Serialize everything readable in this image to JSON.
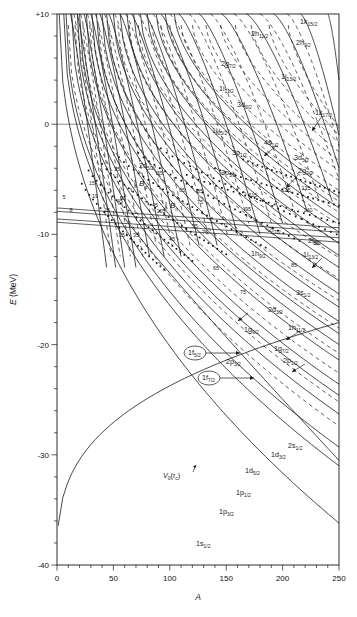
{
  "figure": {
    "domain": "chart",
    "background": "#ffffff",
    "line_color": "#1a1a1a"
  },
  "chart_data": {
    "type": "line",
    "title": "",
    "xlabel": "A",
    "ylabel": "E (MeV)",
    "xlim": [
      0,
      250
    ],
    "ylim": [
      -40,
      10
    ],
    "xticks": [
      0,
      50,
      100,
      150,
      200,
      250
    ],
    "xticklabels": [
      "0",
      "50",
      "100",
      "150",
      "200",
      "250"
    ],
    "yticks": [
      10,
      0,
      -10,
      -20,
      -30,
      -40
    ],
    "yticklabels": [
      "+10",
      "0",
      "-10",
      "-20",
      "-30",
      "-40"
    ],
    "minor_tick_step_y": 2,
    "minor_tick_step_x": 10,
    "grid": false,
    "legend": null,
    "orbital_labels": [
      {
        "label": "1k",
        "sub": "15/2",
        "x": 300,
        "y": 24
      },
      {
        "label": "2h",
        "sub": "11/2",
        "x": 251,
        "y": 36
      },
      {
        "label": "2h",
        "sub": "9/2",
        "x": 296,
        "y": 45
      },
      {
        "label": "2g",
        "sub": "7/2",
        "x": 221,
        "y": 66
      },
      {
        "label": "1j",
        "sub": "13/2",
        "x": 281,
        "y": 79
      },
      {
        "label": "1i",
        "sub": "11/2",
        "x": 219,
        "y": 91
      },
      {
        "label": "3d",
        "sub": "3/2",
        "x": 237,
        "y": 107
      },
      {
        "label": "1k",
        "sub": "17/2",
        "x": 315,
        "y": 115
      },
      {
        "label": "4s",
        "sub": "1/2",
        "x": 264,
        "y": 145
      },
      {
        "label": "1j",
        "sub": "15/2",
        "x": 212,
        "y": 133
      },
      {
        "label": "3p",
        "sub": "1/2",
        "x": 232,
        "y": 155
      },
      {
        "label": "3d",
        "sub": "5/2",
        "x": 294,
        "y": 160
      },
      {
        "label": "3p",
        "sub": "3/2",
        "x": 221,
        "y": 175
      },
      {
        "label": "2g",
        "sub": "9/2",
        "x": 298,
        "y": 173
      },
      {
        "label": "2d",
        "sub": "5/2",
        "x": 139,
        "y": 168
      },
      {
        "label": "2f",
        "sub": "7/2",
        "x": 268,
        "y": 232
      },
      {
        "label": "2f",
        "sub": "5/2",
        "x": 308,
        "y": 243
      },
      {
        "label": "1h",
        "sub": "9/2",
        "x": 251,
        "y": 256
      },
      {
        "label": "1i",
        "sub": "13/2",
        "x": 303,
        "y": 257
      },
      {
        "label": "3s",
        "sub": "1/2",
        "x": 296,
        "y": 295
      },
      {
        "label": "2d",
        "sub": "3/2",
        "x": 268,
        "y": 312
      },
      {
        "label": "1h",
        "sub": "11/2",
        "x": 288,
        "y": 330
      },
      {
        "label": "1g",
        "sub": "9/2",
        "x": 244,
        "y": 332
      },
      {
        "label": "1g",
        "sub": "7/2",
        "x": 274,
        "y": 351
      },
      {
        "label": "2p",
        "sub": "3/2",
        "x": 226,
        "y": 364
      },
      {
        "label": "2p",
        "sub": "1/2",
        "x": 283,
        "y": 363
      },
      {
        "label": "2s",
        "sub": "1/2",
        "x": 288,
        "y": 448
      },
      {
        "label": "1d",
        "sub": "3/2",
        "x": 271,
        "y": 457
      },
      {
        "label": "1d",
        "sub": "5/2",
        "x": 245,
        "y": 473
      },
      {
        "label": "1p",
        "sub": "1/2",
        "x": 236,
        "y": 495
      },
      {
        "label": "1p",
        "sub": "3/2",
        "x": 219,
        "y": 514
      },
      {
        "label": "1s",
        "sub": "1/2",
        "x": 196,
        "y": 546
      }
    ],
    "circled_labels": [
      {
        "label": "1f",
        "sub": "5/2",
        "x": 188,
        "y": 355
      },
      {
        "label": "1f",
        "sub": "7/2",
        "x": 202,
        "y": 380
      }
    ],
    "binding_labels": [
      {
        "label": "B",
        "sub": "p",
        "x": 139,
        "y": 186
      },
      {
        "label": "B",
        "sub": "n",
        "x": 170,
        "y": 208
      }
    ],
    "potential_label": {
      "label": "V",
      "sub": "0",
      "suffix": "(r",
      "suffix_sub": "c",
      "suffix_end": ")",
      "x": 163,
      "y": 478
    },
    "magic_numbers": [
      {
        "value": "5",
        "x": 64,
        "y": 199
      },
      {
        "value": "8",
        "x": 71,
        "y": 212
      },
      {
        "value": "15",
        "x": 92,
        "y": 185
      },
      {
        "value": "19",
        "x": 95,
        "y": 198
      },
      {
        "value": "25",
        "x": 107,
        "y": 212
      },
      {
        "value": "25",
        "x": 122,
        "y": 237
      },
      {
        "value": "35",
        "x": 117,
        "y": 171
      },
      {
        "value": "35",
        "x": 136,
        "y": 237
      },
      {
        "value": "45",
        "x": 120,
        "y": 203
      },
      {
        "value": "45",
        "x": 155,
        "y": 207
      },
      {
        "value": "45",
        "x": 172,
        "y": 241
      },
      {
        "value": "55",
        "x": 160,
        "y": 175
      },
      {
        "value": "55",
        "x": 195,
        "y": 228
      },
      {
        "value": "65",
        "x": 182,
        "y": 192
      },
      {
        "value": "65",
        "x": 216,
        "y": 270
      },
      {
        "value": "75",
        "x": 200,
        "y": 204
      },
      {
        "value": "75",
        "x": 243,
        "y": 294
      },
      {
        "value": "76",
        "x": 205,
        "y": 234
      },
      {
        "value": "85",
        "x": 200,
        "y": 193
      },
      {
        "value": "85",
        "x": 294,
        "y": 267
      },
      {
        "value": "85",
        "x": 316,
        "y": 245
      },
      {
        "value": "95",
        "x": 123,
        "y": 200
      },
      {
        "value": "95",
        "x": 248,
        "y": 211
      },
      {
        "value": "105",
        "x": 161,
        "y": 213
      },
      {
        "value": "115",
        "x": 253,
        "y": 197
      },
      {
        "value": "125",
        "x": 286,
        "y": 192
      },
      {
        "value": "135",
        "x": 306,
        "y": 190
      },
      {
        "value": "140",
        "x": 308,
        "y": 212
      }
    ]
  }
}
